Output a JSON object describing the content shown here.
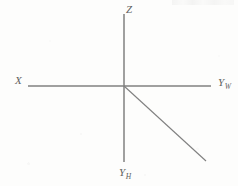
{
  "figure": {
    "background_color": "#fdfdfc",
    "line_color": "#808080",
    "label_color": "#5f5f5f",
    "width": 238,
    "height": 186,
    "origin": {
      "x": 124,
      "y": 86
    }
  },
  "labels": {
    "z": {
      "text": "Z",
      "sub": ""
    },
    "x": {
      "text": "X",
      "sub": ""
    },
    "y_world": {
      "text": "Y",
      "sub": "W"
    },
    "y_height": {
      "text": "Y",
      "sub": "H"
    }
  },
  "chart_data": {
    "type": "diagram",
    "title": "",
    "subtitle": "",
    "xlabel": "",
    "ylabel": "",
    "grid": false,
    "legend": "none",
    "axes": [
      {
        "name": "Z",
        "label": "Z",
        "subscript": "",
        "direction": "up",
        "from": {
          "x": 124,
          "y": 86
        },
        "to": {
          "x": 124,
          "y": 14
        },
        "label_position": {
          "x": 128,
          "y": 9
        }
      },
      {
        "name": "Y_H",
        "label": "Y",
        "subscript": "H",
        "direction": "down",
        "from": {
          "x": 124,
          "y": 86
        },
        "to": {
          "x": 124,
          "y": 162
        },
        "label_position": {
          "x": 124,
          "y": 172
        }
      },
      {
        "name": "X",
        "label": "X",
        "subscript": "",
        "direction": "left",
        "from": {
          "x": 124,
          "y": 86
        },
        "to": {
          "x": 28,
          "y": 86
        },
        "label_position": {
          "x": 19,
          "y": 80
        }
      },
      {
        "name": "Y_W",
        "label": "Y",
        "subscript": "W",
        "direction": "right",
        "from": {
          "x": 124,
          "y": 86
        },
        "to": {
          "x": 211,
          "y": 86
        },
        "label_position": {
          "x": 222,
          "y": 82
        }
      },
      {
        "name": "diagonal",
        "label": "",
        "subscript": "",
        "direction": "down-right",
        "from": {
          "x": 124,
          "y": 86
        },
        "to": {
          "x": 206,
          "y": 161
        },
        "label_position": null
      }
    ],
    "annotations": []
  }
}
